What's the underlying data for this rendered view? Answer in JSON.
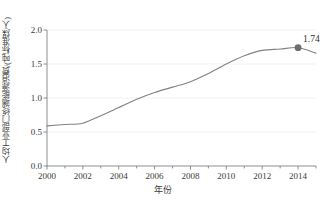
{
  "chart_data": {
    "type": "line",
    "title": "",
    "xlabel": "年份",
    "ylabel": "人均工业部门终端能源消费/(吨标准煤/人)",
    "xlim": [
      2000,
      2015
    ],
    "ylim": [
      0.0,
      2.0
    ],
    "grid": true,
    "legend": "none",
    "xticks": [
      "2000",
      "2002",
      "2004",
      "2006",
      "2008",
      "2010",
      "2012",
      "2014"
    ],
    "xtick_values": [
      2000,
      2002,
      2004,
      2006,
      2008,
      2010,
      2012,
      2014
    ],
    "xminor_step": 1,
    "yticks": [
      "0.0",
      "0.5",
      "1.0",
      "1.5",
      "2.0"
    ],
    "ytick_values": [
      0.0,
      0.5,
      1.0,
      1.5,
      2.0
    ],
    "x": [
      2000,
      2001,
      2002,
      2003,
      2004,
      2005,
      2006,
      2007,
      2008,
      2009,
      2010,
      2011,
      2012,
      2013,
      2014,
      2015
    ],
    "values": [
      0.59,
      0.61,
      0.63,
      0.74,
      0.86,
      0.98,
      1.08,
      1.16,
      1.24,
      1.36,
      1.5,
      1.62,
      1.7,
      1.72,
      1.74,
      1.66
    ],
    "series": [
      {
        "name": "人均工业部门终端能源消费",
        "values": [
          0.59,
          0.61,
          0.63,
          0.74,
          0.86,
          0.98,
          1.08,
          1.16,
          1.24,
          1.36,
          1.5,
          1.62,
          1.7,
          1.72,
          1.74,
          1.66
        ]
      }
    ],
    "annotations": [
      {
        "label": "1.74",
        "x": 2014,
        "y": 1.74,
        "marker": "circle"
      }
    ],
    "colors": {
      "line": "#808285",
      "marker": "#6d6e71",
      "axis": "#808285",
      "grid": "#ededed",
      "text": "#3a3a3a"
    }
  }
}
